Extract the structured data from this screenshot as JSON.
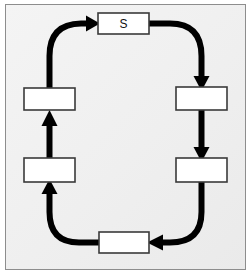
{
  "diagram": {
    "type": "cycle-flowchart",
    "direction": "clockwise",
    "background_color": "#efefef",
    "frame_color": "#8d8d8d",
    "node_fill": "#ffffff",
    "node_border_color": "#3a3a3a",
    "arrow_color": "#000000",
    "nodes": [
      {
        "id": "s",
        "label": "S",
        "x": 98,
        "y": 13,
        "w": 51,
        "h": 21
      },
      {
        "id": "right-upper",
        "label": "",
        "x": 176,
        "y": 87,
        "w": 51,
        "h": 23
      },
      {
        "id": "right-lower",
        "label": "",
        "x": 176,
        "y": 158,
        "w": 51,
        "h": 24
      },
      {
        "id": "bottom",
        "label": "",
        "x": 99,
        "y": 232,
        "w": 50,
        "h": 21
      },
      {
        "id": "left-lower",
        "label": "",
        "x": 24,
        "y": 158,
        "w": 51,
        "h": 24
      },
      {
        "id": "left-upper",
        "label": "",
        "x": 24,
        "y": 88,
        "w": 51,
        "h": 22
      }
    ],
    "edges": [
      {
        "id": "s-to-right-upper",
        "from": "s",
        "to": "right-upper",
        "shape": "curve"
      },
      {
        "id": "right-upper-to-lower",
        "from": "right-upper",
        "to": "right-lower",
        "shape": "straight"
      },
      {
        "id": "right-lower-to-bottom",
        "from": "right-lower",
        "to": "bottom",
        "shape": "curve"
      },
      {
        "id": "bottom-to-left-lower",
        "from": "bottom",
        "to": "left-lower",
        "shape": "curve"
      },
      {
        "id": "left-lower-to-left-upper",
        "from": "left-lower",
        "to": "left-upper",
        "shape": "straight"
      },
      {
        "id": "left-upper-to-s",
        "from": "left-upper",
        "to": "s",
        "shape": "curve"
      }
    ]
  }
}
